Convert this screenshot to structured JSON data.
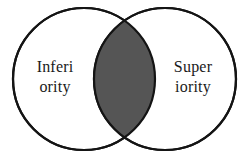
{
  "diagram": {
    "type": "venn",
    "title": "",
    "background_color": "#ffffff",
    "stroke_color": "#141414",
    "stroke_width": 2.2,
    "circle_fill": "#ffffff",
    "intersection_fill": "#555555",
    "text_color": "#1a1a1a",
    "sets": [
      {
        "id": "left",
        "name": "inferiority",
        "label_line1": "Inferi",
        "label_line2": "ority",
        "center_x": 84,
        "center_y": 79,
        "radius": 71,
        "label_x": 55,
        "label_y1": 72,
        "label_y2": 92
      },
      {
        "id": "right",
        "name": "superiority",
        "label_line1": "Super",
        "label_line2": "iority",
        "center_x": 165,
        "center_y": 79,
        "radius": 71,
        "label_x": 193,
        "label_y1": 72,
        "label_y2": 92
      }
    ],
    "intersection": {
      "name": "overlap-lens",
      "label": "",
      "top_point_x": 124.5,
      "top_point_y": 19,
      "bottom_point_x": 124.5,
      "bottom_point_y": 139,
      "fill": "#555555"
    }
  }
}
